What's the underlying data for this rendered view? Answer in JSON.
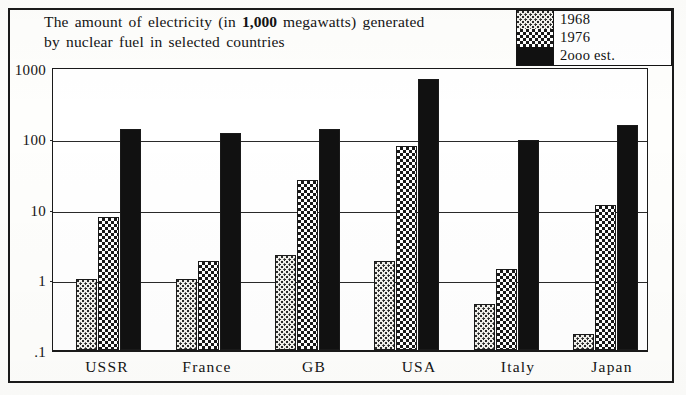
{
  "title": {
    "line1_prefix": "The amount of electricity (in ",
    "line1_strong": "1,000",
    "line1_suffix": " megawatts) generated",
    "line2": "by nuclear fuel in selected countries"
  },
  "legend": {
    "entries": [
      {
        "label": "1968",
        "swatch": "light-dotted",
        "color": "#f2f1ec"
      },
      {
        "label": "1976",
        "swatch": "checkered",
        "color": "#2b2b2b"
      },
      {
        "label": "2ooo est.",
        "swatch": "solid-black",
        "color": "#111111"
      }
    ]
  },
  "axis": {
    "y_ticks": [
      "1000",
      "100",
      "10",
      "1",
      ".1"
    ],
    "x_labels": [
      "USSR",
      "France",
      "GB",
      "USA",
      "Italy",
      "Japan"
    ]
  },
  "chart_data": {
    "type": "bar",
    "title": "The amount of electricity (in 1,000 megawatts) generated by nuclear fuel in selected countries",
    "xlabel": "",
    "ylabel": "",
    "yscale": "log",
    "ylim": [
      0.1,
      1000
    ],
    "ytick_values": [
      0.1,
      1,
      10,
      100,
      1000
    ],
    "ytick_labels": [
      ".1",
      "1",
      "10",
      "100",
      "1000"
    ],
    "grid": true,
    "legend_position": "top-right",
    "categories": [
      "USSR",
      "France",
      "GB",
      "USA",
      "Italy",
      "Japan"
    ],
    "series": [
      {
        "name": "1968",
        "values": [
          1.0,
          1.0,
          2.2,
          1.8,
          0.45,
          0.17
        ]
      },
      {
        "name": "1976",
        "values": [
          7.5,
          1.8,
          25,
          75,
          1.4,
          11
        ]
      },
      {
        "name": "2000 est.",
        "values": [
          130,
          115,
          130,
          650,
          90,
          150
        ]
      }
    ]
  }
}
